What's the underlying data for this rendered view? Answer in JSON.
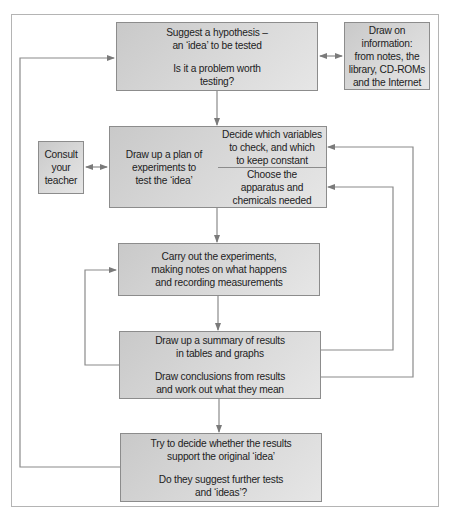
{
  "diagram": {
    "type": "flowchart",
    "colors": {
      "box_fill_start": "#c9c9c9",
      "box_fill_end": "#e6e6e6",
      "box_border": "#8c8c8c",
      "line": "#8a8a8a",
      "frame": "#b4b4b4"
    },
    "hypothesis": {
      "line1": "Suggest a hypothesis –",
      "line2": "an ‘idea’ to be tested",
      "line3": "Is it a problem worth",
      "line4": "testing?"
    },
    "information": {
      "line1": "Draw on",
      "line2": "information:",
      "line3": "from notes, the",
      "line4": "library, CD-ROMs",
      "line5": "and the Internet"
    },
    "consult": {
      "line1": "Consult",
      "line2": "your",
      "line3": "teacher"
    },
    "plan": {
      "main": {
        "line1": "Draw up a plan of",
        "line2": "experiments to",
        "line3": "test the ‘idea’"
      },
      "variables": {
        "line1": "Decide which variables",
        "line2": "to check, and which",
        "line3": "to keep constant"
      },
      "apparatus": {
        "line1": "Choose the",
        "line2": "apparatus and",
        "line3": "chemicals needed"
      }
    },
    "experiments": {
      "line1": "Carry out the experiments,",
      "line2": "making notes on what happens",
      "line3": "and recording measurements"
    },
    "summary": {
      "line1": "Draw up a summary of results",
      "line2": "in tables and graphs",
      "line3": "Draw conclusions from results",
      "line4": "and work out what they mean"
    },
    "evaluate": {
      "line1": "Try to decide whether the results",
      "line2": "support the original ‘idea’",
      "line3": "Do they suggest further tests",
      "line4": "and ‘ideas’?"
    }
  }
}
